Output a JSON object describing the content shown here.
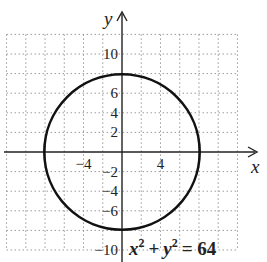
{
  "chart_data": {
    "type": "line",
    "title": "",
    "equation": "x^2 + y^2 = 64",
    "equation_parts": {
      "x": "x",
      "y": "y",
      "exp": "2",
      "plus": "+",
      "equals": "= 64"
    },
    "curve": {
      "shape": "circle",
      "center": [
        0,
        0
      ],
      "radius": 8
    },
    "xlabel": "x",
    "ylabel": "y",
    "xlim": [
      -12,
      12
    ],
    "ylim": [
      -10,
      12
    ],
    "grid": true,
    "grid_step": 2,
    "x_ticks": [
      {
        "value": -4,
        "label": "−4"
      },
      {
        "value": 4,
        "label": "4"
      }
    ],
    "y_ticks": [
      {
        "value": 10,
        "label": "10"
      },
      {
        "value": 6,
        "label": "6"
      },
      {
        "value": 4,
        "label": "4"
      },
      {
        "value": 2,
        "label": "2"
      },
      {
        "value": -2,
        "label": "−2"
      },
      {
        "value": -4,
        "label": "−4"
      },
      {
        "value": -6,
        "label": "−6"
      },
      {
        "value": -10,
        "label": "−10"
      }
    ]
  },
  "colors": {
    "curve": "#111111",
    "axis": "#222222",
    "grid": "#9a9a9a",
    "background": "#ffffff"
  }
}
